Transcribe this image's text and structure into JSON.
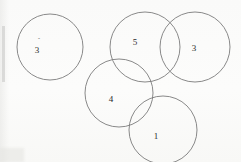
{
  "figure": {
    "background_color": "#fbfbfa",
    "stroke_color": "#7c7c7c",
    "stroke_width": 0.9,
    "label_color": "#2a2a2a",
    "canvas": {
      "width": 241,
      "height": 162
    },
    "artifact_marks": [
      {
        "name": "speck-above-label-3",
        "text": "ˆ",
        "x": 39,
        "y": 40
      }
    ],
    "circles": [
      {
        "name": "circle-left",
        "label": "3",
        "cx": 50,
        "cy": 47,
        "r": 33,
        "label_x": 37,
        "label_y": 50
      },
      {
        "name": "circle-top-middle",
        "label": "5",
        "cx": 145,
        "cy": 47,
        "r": 35,
        "label_x": 135,
        "label_y": 42
      },
      {
        "name": "circle-top-right",
        "label": "3",
        "cx": 195,
        "cy": 47,
        "r": 35,
        "label_x": 194,
        "label_y": 48
      },
      {
        "name": "circle-lower-middle",
        "label": "4",
        "cx": 119,
        "cy": 93,
        "r": 34,
        "label_x": 111,
        "label_y": 99
      },
      {
        "name": "circle-lower-right",
        "label": "1",
        "cx": 163,
        "cy": 130,
        "r": 34,
        "label_x": 156,
        "label_y": 136
      }
    ]
  },
  "chart_data": {
    "type": "diagram",
    "subtype": "venn-like-circle-overlap",
    "title": "",
    "labels": [
      "3",
      "5",
      "3",
      "4",
      "1"
    ],
    "values": [
      3,
      5,
      3,
      4,
      1
    ],
    "circle_count": 5,
    "grid": false,
    "legend": "none"
  }
}
